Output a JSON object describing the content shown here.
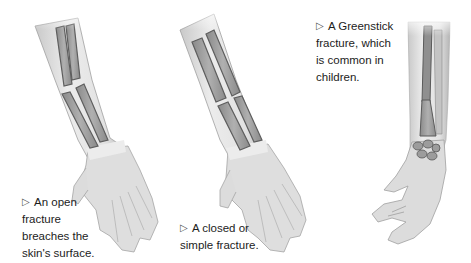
{
  "figure": {
    "panels": [
      {
        "id": "open",
        "caption_lines": [
          "An open",
          "fracture",
          "breaches the",
          "skin's surface."
        ]
      },
      {
        "id": "closed",
        "caption_lines": [
          "A closed or",
          "simple fracture."
        ]
      },
      {
        "id": "greenstick",
        "caption_lines": [
          "A Greenstick",
          "fracture, which",
          "is common in",
          "children."
        ]
      }
    ],
    "arrow_glyph": "▷",
    "colors": {
      "skin": "#d9d9d9",
      "skin_shadow": "#a8a8a8",
      "bone_fill": "#9a9a9a",
      "bone_edge": "#5e5e5e",
      "text": "#1c1c1c"
    }
  }
}
